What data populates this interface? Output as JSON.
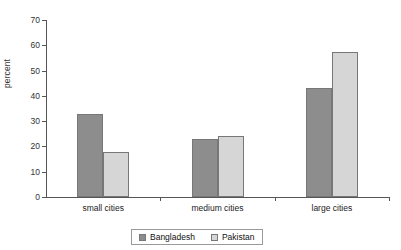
{
  "chart_data": {
    "type": "bar",
    "title": "",
    "xlabel": "",
    "ylabel": "percent",
    "ylim": [
      0,
      70
    ],
    "yticks": [
      0,
      10,
      20,
      30,
      40,
      50,
      60,
      70
    ],
    "grid": false,
    "legend_position": "bottom",
    "categories": [
      "small cities",
      "medium cities",
      "large cities"
    ],
    "series": [
      {
        "name": "Bangladesh",
        "color": "#8d8d8d",
        "values": [
          33,
          23,
          43
        ]
      },
      {
        "name": "Pakistan",
        "color": "#d6d6d6",
        "values": [
          18,
          24,
          57.5
        ]
      }
    ]
  }
}
